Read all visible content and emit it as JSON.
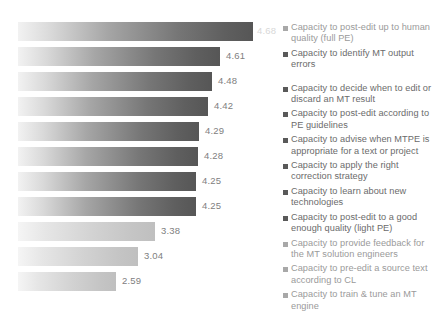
{
  "chart_data": {
    "type": "bar",
    "title": "",
    "subtitle": "",
    "xlabel": "",
    "ylabel": "",
    "orientation": "horizontal",
    "grid": false,
    "legend_position": "right",
    "xlim": [
      0,
      5
    ],
    "categories": [
      "Capacity to post-edit up to human quality (full PE)",
      "Capacity to identify MT output errors",
      "Capacity to decide when to edit or discard an MT result",
      "Capacity to post-edit according to PE guidelines",
      "Capacity to advise when MTPE is appropriate for a text or project",
      "Capacity to apply the right correction strategy",
      "Capacity to learn about new technologies",
      "Capacity to post-edit to a good enough quality (light PE)",
      "Capacity to provide feedback for the MT solution engineers",
      "Capacity to pre-edit a source text according to CL",
      "Capacity to train & tune an MT engine"
    ],
    "values": [
      4.68,
      4.61,
      4.48,
      4.42,
      4.29,
      4.28,
      4.25,
      4.25,
      3.38,
      3.04,
      2.59
    ],
    "value_labels": [
      "4.68",
      "4.61",
      "4.48",
      "4.42",
      "4.29",
      "4.28",
      "4.25",
      "4.25",
      "3.38",
      "3.04",
      "2.59"
    ]
  },
  "bars": [
    {
      "label": "4.68",
      "width_px": 235,
      "label_left_px": 239,
      "label_inside": true,
      "style": "dark"
    },
    {
      "label": "4.61",
      "width_px": 202,
      "label_left_px": 208,
      "label_inside": false,
      "style": "dark"
    },
    {
      "label": "4.48",
      "width_px": 194,
      "label_left_px": 200,
      "label_inside": false,
      "style": "dark"
    },
    {
      "label": "4.42",
      "width_px": 190,
      "label_left_px": 196,
      "label_inside": false,
      "style": "dark"
    },
    {
      "label": "4.29",
      "width_px": 181,
      "label_left_px": 187,
      "label_inside": false,
      "style": "dark"
    },
    {
      "label": "4.28",
      "width_px": 180,
      "label_left_px": 186,
      "label_inside": false,
      "style": "dark"
    },
    {
      "label": "4.25",
      "width_px": 178,
      "label_left_px": 184,
      "label_inside": false,
      "style": "dark"
    },
    {
      "label": "4.25",
      "width_px": 178,
      "label_left_px": 184,
      "label_inside": false,
      "style": "dark"
    },
    {
      "label": "3.38",
      "width_px": 137,
      "label_left_px": 143,
      "label_inside": false,
      "style": "light"
    },
    {
      "label": "3.04",
      "width_px": 120,
      "label_left_px": 126,
      "label_inside": false,
      "style": "light"
    },
    {
      "label": "2.59",
      "width_px": 98,
      "label_left_px": 104,
      "label_inside": false,
      "style": "light"
    }
  ],
  "legend": {
    "marker_icon": "square-marker",
    "items": [
      {
        "label": "Capacity to post-edit up to human quality (full PE)",
        "faint": true,
        "spacer_after": 3
      },
      {
        "label": "Capacity to identify MT output errors",
        "faint": false,
        "spacer_after": 12
      },
      {
        "label": "Capacity to decide when to edit or discard an MT result",
        "faint": false,
        "spacer_after": 3
      },
      {
        "label": "Capacity to post-edit according to PE guidelines",
        "faint": false,
        "spacer_after": 3
      },
      {
        "label": "Capacity to advise when MTPE is appropriate for a text or project",
        "faint": false,
        "spacer_after": 3
      },
      {
        "label": "Capacity to apply the right correction strategy",
        "faint": false,
        "spacer_after": 3
      },
      {
        "label": "Capacity to learn about new technologies",
        "faint": false,
        "spacer_after": 3
      },
      {
        "label": "Capacity to post-edit to a good enough quality (light PE)",
        "faint": false,
        "spacer_after": 3
      },
      {
        "label": "Capacity to provide feedback for the MT solution engineers",
        "faint": true,
        "spacer_after": 3
      },
      {
        "label": "Capacity to pre-edit a source text according to CL",
        "faint": true,
        "spacer_after": 3
      },
      {
        "label": "Capacity to train & tune an MT engine",
        "faint": true,
        "spacer_after": 0
      }
    ]
  },
  "colors": {
    "bar_gradient_start": "#f2f2f2",
    "bar_gradient_end": "#565656",
    "bar_light_start": "#f5f5f5",
    "bar_light_end": "#bfbfbf",
    "value_text": "#808080",
    "value_text_inside": "#d8d8d8",
    "legend_text": "#6b6b6b",
    "legend_marker": "#595959",
    "background": "#ffffff"
  }
}
